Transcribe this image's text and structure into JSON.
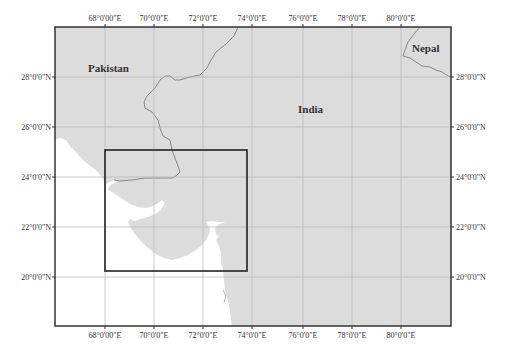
{
  "map": {
    "labels": {
      "pakistan": "Pakistan",
      "india": "India",
      "nepal": "Nepal"
    },
    "longitude_ticks": [
      "68°0'00\"E",
      "70°0'0\"E",
      "72°0'0\"E",
      "74°0'0\"E",
      "76°0'0\"E",
      "78°0'0\"E",
      "80°0'0\"E"
    ],
    "latitude_ticks": [
      "28°0'0\"N",
      "26°0'0\"N",
      "24°0'0\"N",
      "22°0'0\"N",
      "20°0'0\"N"
    ],
    "colors": {
      "land": "#dcdcdc",
      "sea": "#ffffff",
      "border": "#888888",
      "grid": "#b5b5b5",
      "frame": "#333333",
      "inset_box": "#222222"
    },
    "inset_box": {
      "lon_range": [
        "68°E",
        "~73.8°E"
      ],
      "lat_range": [
        "~20.2°N",
        "~25.1°N"
      ]
    }
  },
  "tick": {
    "top": {
      "0": "68°0'00\"E",
      "1": "70°0'0\"E",
      "2": "72°0'0\"E",
      "3": "74°0'0\"E",
      "4": "76°0'0\"E",
      "5": "78°0'0\"E",
      "6": "80°0'0\"E"
    },
    "left": {
      "0": "28°0'0\"N",
      "1": "26°0'0\"N",
      "2": "24°0'0\"N",
      "3": "22°0'0\"N",
      "4": "20°0'0\"N"
    }
  }
}
